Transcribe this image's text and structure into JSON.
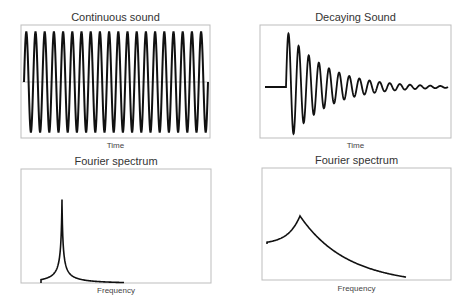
{
  "panels": [
    {
      "title": "Continuous sound",
      "xlabel": "Time"
    },
    {
      "title": "Decaying Sound",
      "xlabel": "Time"
    },
    {
      "title": "Fourier spectrum",
      "xlabel": "Frequency"
    },
    {
      "title": "Fourier spectrum",
      "xlabel": "Frequency"
    }
  ],
  "chart_data": [
    {
      "type": "line",
      "title": "Continuous sound",
      "xlabel": "Time",
      "ylabel": "",
      "description": "Constant-amplitude sine wave, ~20 cycles",
      "cycles": 20,
      "amplitude": 1,
      "decay": 0,
      "grid": false
    },
    {
      "type": "line",
      "title": "Decaying Sound",
      "xlabel": "Time",
      "ylabel": "",
      "description": "Flat until onset, then exponentially decaying oscillation",
      "cycles_after_onset": 16,
      "amplitude": 1,
      "decay": "exponential",
      "grid": false
    },
    {
      "type": "line",
      "title": "Fourier spectrum",
      "xlabel": "Frequency",
      "ylabel": "",
      "description": "Very sharp narrow peak (continuous sound)",
      "peak_position_frac": 0.21,
      "peak_width": "narrow",
      "grid": false
    },
    {
      "type": "line",
      "title": "Fourier spectrum",
      "xlabel": "Frequency",
      "ylabel": "",
      "description": "Broad low peak (decaying sound)",
      "peak_position_frac": 0.2,
      "peak_width": "broad",
      "grid": false
    }
  ]
}
